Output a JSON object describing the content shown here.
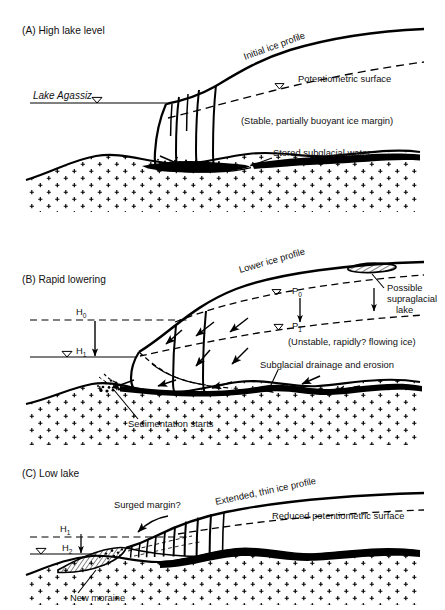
{
  "figure": {
    "type": "diagram",
    "panel_count": 3
  },
  "panels": [
    {
      "id": "A",
      "title": "(A) High lake level",
      "labels": {
        "lake_name": "Lake Agassiz",
        "ice_profile": "Initial ice profile",
        "potentiometric": "Potentiometric surface",
        "margin_note": "(Stable, partially buoyant ice margin)",
        "subglacial_water": "Stored subglacial water"
      }
    },
    {
      "id": "B",
      "title": "(B) Rapid lowering",
      "labels": {
        "ice_profile": "Lower ice profile",
        "supraglacial_lake": "Possible supraglacial lake",
        "supraglacial_line1": "Possible",
        "supraglacial_line2": "supraglacial",
        "supraglacial_line3": "lake",
        "flow_note": "(Unstable, rapidly? flowing ice)",
        "drainage": "Subglacial drainage and erosion",
        "sedimentation": "Sedimentation starts",
        "h0": "H",
        "h0_sub": "0",
        "h1": "H",
        "h1_sub": "1",
        "p0": "P",
        "p0_sub": "0",
        "p1": "P",
        "p1_sub": "1"
      }
    },
    {
      "id": "C",
      "title": "(C) Low lake",
      "labels": {
        "surged_margin": "Surged margin?",
        "ice_profile": "Extended, thin ice profile",
        "potentiometric": "Reduced potentiometric surface",
        "new_moraine": "New moraine",
        "h1": "H",
        "h1_sub": "1",
        "h2": "H",
        "h2_sub": "2"
      }
    }
  ],
  "colors": {
    "ink": "#000000",
    "background": "#ffffff",
    "water_fill": "#000000",
    "bedrock_symbol": "#000000"
  },
  "symbols": {
    "water_table": "water-table-triangle",
    "bedrock": "plus-sign-crystalline-bedrock",
    "stored_water": "solid-black-lens",
    "supraglacial_lake": "hatched-lens",
    "moraine": "hatched-wedge"
  }
}
